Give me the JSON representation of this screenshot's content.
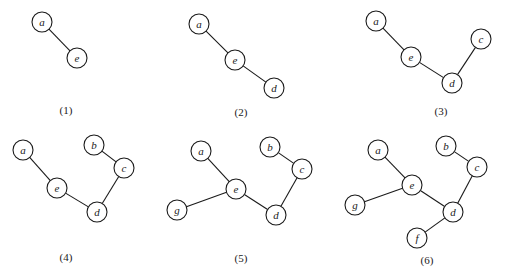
{
  "diagram": {
    "type": "spanning-tree-construction-steps",
    "node_radius": 10,
    "colors": {
      "stroke": "#1a1a1a",
      "fill": "#ffffff",
      "text": "#1a1a1a"
    },
    "panels": [
      {
        "label": "(1)",
        "label_pos": [
          66,
          110
        ],
        "nodes": [
          {
            "id": "a",
            "x": 42,
            "y": 22
          },
          {
            "id": "e",
            "x": 77,
            "y": 58
          }
        ],
        "edges": [
          [
            "a",
            "e"
          ]
        ]
      },
      {
        "label": "(2)",
        "label_pos": [
          241,
          112
        ],
        "nodes": [
          {
            "id": "a",
            "x": 199,
            "y": 24
          },
          {
            "id": "e",
            "x": 235,
            "y": 60
          },
          {
            "id": "d",
            "x": 274,
            "y": 88
          }
        ],
        "edges": [
          [
            "a",
            "e"
          ],
          [
            "e",
            "d"
          ]
        ]
      },
      {
        "label": "(3)",
        "label_pos": [
          441,
          111
        ],
        "nodes": [
          {
            "id": "a",
            "x": 376,
            "y": 21
          },
          {
            "id": "e",
            "x": 411,
            "y": 57
          },
          {
            "id": "d",
            "x": 452,
            "y": 83
          },
          {
            "id": "c",
            "x": 481,
            "y": 39
          }
        ],
        "edges": [
          [
            "a",
            "e"
          ],
          [
            "e",
            "d"
          ],
          [
            "d",
            "c"
          ]
        ]
      },
      {
        "label": "(4)",
        "label_pos": [
          66,
          257
        ],
        "nodes": [
          {
            "id": "a",
            "x": 23,
            "y": 150
          },
          {
            "id": "b",
            "x": 94,
            "y": 145
          },
          {
            "id": "e",
            "x": 57,
            "y": 188
          },
          {
            "id": "c",
            "x": 124,
            "y": 168
          },
          {
            "id": "d",
            "x": 97,
            "y": 212
          }
        ],
        "edges": [
          [
            "a",
            "e"
          ],
          [
            "e",
            "d"
          ],
          [
            "d",
            "c"
          ],
          [
            "b",
            "c"
          ]
        ]
      },
      {
        "label": "(5)",
        "label_pos": [
          241,
          258
        ],
        "nodes": [
          {
            "id": "a",
            "x": 201,
            "y": 151
          },
          {
            "id": "b",
            "x": 270,
            "y": 147
          },
          {
            "id": "e",
            "x": 236,
            "y": 189
          },
          {
            "id": "c",
            "x": 302,
            "y": 169
          },
          {
            "id": "g",
            "x": 177,
            "y": 210
          },
          {
            "id": "d",
            "x": 276,
            "y": 215
          }
        ],
        "edges": [
          [
            "a",
            "e"
          ],
          [
            "e",
            "d"
          ],
          [
            "d",
            "c"
          ],
          [
            "b",
            "c"
          ],
          [
            "g",
            "e"
          ]
        ]
      },
      {
        "label": "(6)",
        "label_pos": [
          427,
          260
        ],
        "nodes": [
          {
            "id": "a",
            "x": 378,
            "y": 150
          },
          {
            "id": "b",
            "x": 446,
            "y": 146
          },
          {
            "id": "e",
            "x": 412,
            "y": 185
          },
          {
            "id": "c",
            "x": 477,
            "y": 167
          },
          {
            "id": "g",
            "x": 355,
            "y": 205
          },
          {
            "id": "d",
            "x": 453,
            "y": 212
          },
          {
            "id": "f",
            "x": 417,
            "y": 238
          }
        ],
        "edges": [
          [
            "a",
            "e"
          ],
          [
            "e",
            "d"
          ],
          [
            "d",
            "c"
          ],
          [
            "b",
            "c"
          ],
          [
            "g",
            "e"
          ],
          [
            "d",
            "f"
          ]
        ]
      }
    ]
  }
}
